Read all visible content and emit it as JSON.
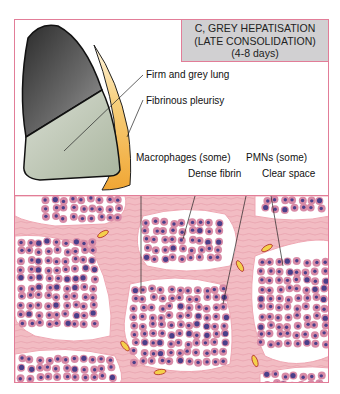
{
  "title": {
    "line1": "C, GREY HEPATISATION",
    "line2": "(LATE CONSOLIDATION)",
    "line3": "(4-8 days)"
  },
  "labels": {
    "firm_grey_lung": "Firm and grey lung",
    "fibrinous_pleurisy": "Fibrinous pleurisy",
    "macrophages": "Macrophages (some)",
    "pmns": "PMNs (some)",
    "dense_fibrin": "Dense fibrin",
    "clear_space": "Clear space"
  },
  "colors": {
    "frame_border": "#e27d98",
    "title_bg": "#d1d0d2",
    "lung_upper": "#3a3a3a",
    "lung_lower": "#b7c2ae",
    "pleurisy": "#f0a634",
    "tissue_bg": "#f2bcc3",
    "cell": "#d78aa6",
    "nucleus": "#4a3f8a"
  }
}
